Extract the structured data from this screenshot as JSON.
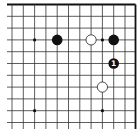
{
  "board": {
    "description": "Go problem diagram, upper-right corner section",
    "colors": {
      "background": "#ffffff",
      "line": "#333333",
      "edge": "#111111",
      "black_stone": "#111111",
      "white_stone": "#ffffff",
      "label_on_black": "#ffffff"
    },
    "x_lines": [
      12,
      23.3,
      34.6,
      45.9,
      57.2,
      68.5,
      79.8,
      91.1,
      102.4,
      113.7,
      125,
      135.5
    ],
    "y_lines": [
      4.5,
      16.3,
      28.1,
      39.9,
      51.7,
      63.5,
      75.3,
      87.1,
      98.9,
      110.7,
      122.5
    ],
    "edges": {
      "top": true,
      "right": true,
      "left": false,
      "bottom": false
    },
    "star_points": [
      {
        "col": 2,
        "row": 3
      },
      {
        "col": 8,
        "row": 3
      },
      {
        "col": 2,
        "row": 9
      },
      {
        "col": 8,
        "row": 9
      }
    ],
    "stones": [
      {
        "color": "black",
        "col": 4,
        "row": 3,
        "label": ""
      },
      {
        "color": "white",
        "col": 7,
        "row": 3,
        "label": ""
      },
      {
        "color": "black",
        "col": 9,
        "row": 3,
        "label": ""
      },
      {
        "color": "black",
        "col": 9,
        "row": 5,
        "label": "1"
      },
      {
        "color": "white",
        "col": 8,
        "row": 7,
        "label": ""
      }
    ]
  }
}
